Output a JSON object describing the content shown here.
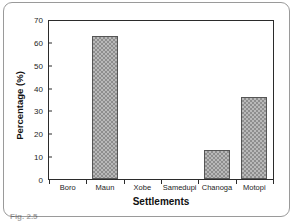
{
  "figure": {
    "caption_fragment": "Fig. 2.5"
  },
  "chart_data": {
    "type": "bar",
    "title": "",
    "xlabel": "Settlements",
    "ylabel": "Percentage (%)",
    "categories": [
      "Boro",
      "Maun",
      "Xobe",
      "Samedupi",
      "Chanoga",
      "Motopi"
    ],
    "values": [
      0,
      62.5,
      0,
      0,
      12.5,
      36
    ],
    "ylim": [
      0,
      70
    ],
    "yticks": [
      0,
      10,
      20,
      30,
      40,
      50,
      60,
      70
    ],
    "ytick_labels": [
      "0",
      "10",
      "20",
      "30",
      "40",
      "50",
      "60",
      "70"
    ],
    "grid": false,
    "legend": "none",
    "bar_fill": "#b9b9b9",
    "bar_pattern": "checkered-hatch",
    "bar_edge_color": "#555555",
    "axis_color": "#2b2b2b",
    "background": "#ffffff"
  }
}
